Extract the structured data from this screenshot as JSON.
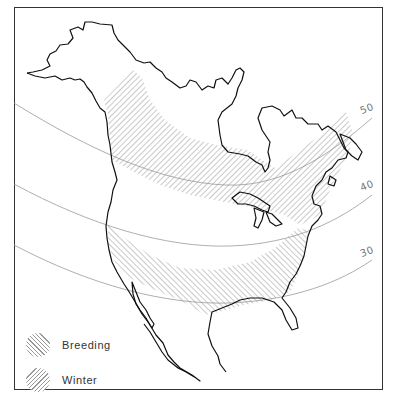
{
  "map": {
    "region": "North America",
    "latitude_lines": [
      {
        "label": "50"
      },
      {
        "label": "40"
      },
      {
        "label": "30"
      }
    ],
    "colors": {
      "coastline": "#111111",
      "latitude_line": "#999999",
      "hatch": "#888888",
      "frame": "#333333"
    }
  },
  "legend": {
    "items": [
      {
        "label": "Breeding",
        "pattern": "diagonal-hatch-right"
      },
      {
        "label": "Winter",
        "pattern": "diagonal-hatch-left"
      }
    ]
  }
}
